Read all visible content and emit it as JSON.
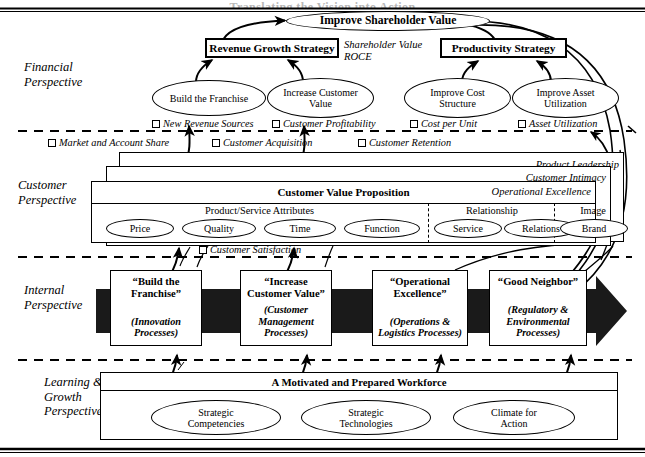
{
  "page": {
    "cut_off_header": "Translating the Vision into Action"
  },
  "perspectives": [
    {
      "id": "financial",
      "label": "Financial\nPerspective"
    },
    {
      "id": "customer",
      "label": "Customer\nPerspective"
    },
    {
      "id": "internal",
      "label": "Internal\nPerspective"
    },
    {
      "id": "learning",
      "label": "Learning &\nGrowth\nPerspective"
    }
  ],
  "financial": {
    "top_oval": "Improve Shareholder Value",
    "strategy_left": "Revenue Growth Strategy",
    "strategy_right": "Productivity Strategy",
    "center_note_line1": "Shareholder Value",
    "center_note_line2": "ROCE",
    "objectives": [
      "Build the Franchise",
      "Increase Customer\nValue",
      "Improve Cost\nStructure",
      "Improve Asset\nUtilization"
    ],
    "measures_row1": [
      "New Revenue Sources",
      "Customer Profitability",
      "Cost per Unit",
      "Asset Utilization"
    ]
  },
  "customer": {
    "measures_row": [
      "Market and Account Share",
      "Customer Acquisition",
      "Customer Retention"
    ],
    "layers": [
      "Product Leadership",
      "Customer Intimacy",
      "Operational Excellence"
    ],
    "value_proposition_title": "Customer Value Proposition",
    "groups": [
      {
        "heading": "Product/Service Attributes",
        "items": [
          "Price",
          "Quality",
          "Time",
          "Function"
        ]
      },
      {
        "heading": "Relationship",
        "items": [
          "Service",
          "Relations"
        ]
      },
      {
        "heading": "Image",
        "items": [
          "Brand"
        ]
      }
    ],
    "bottom_measure": "Customer Satisfaction"
  },
  "internal": {
    "processes": [
      {
        "title": "“Build the Franchise”",
        "sub": "(Innovation\nProcesses)"
      },
      {
        "title": "“Increase\nCustomer Value”",
        "sub": "(Customer\nManagement\nProcesses)"
      },
      {
        "title": "“Operational\nExcellence”",
        "sub": "(Operations &\nLogistics Processes)"
      },
      {
        "title": "“Good Neighbor”",
        "sub": "(Regulatory &\nEnvironmental\nProcesses)"
      }
    ]
  },
  "learning": {
    "header": "A Motivated and Prepared Workforce",
    "items": [
      "Strategic\nCompetencies",
      "Strategic\nTechnologies",
      "Climate for\nAction"
    ]
  },
  "colors": {
    "ink": "#000000",
    "paper": "#ffffff",
    "arrow_band": "#1a1a1a"
  }
}
